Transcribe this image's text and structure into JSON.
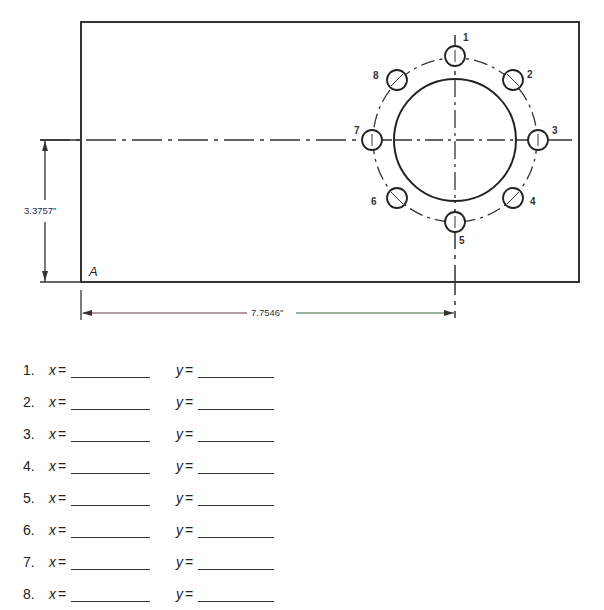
{
  "drawing": {
    "corner_label": "A",
    "dim_vertical": "3.3757\"",
    "dim_horizontal": "7.7546\"",
    "hole_labels": [
      "1",
      "2",
      "3",
      "4",
      "5",
      "6",
      "7",
      "8"
    ]
  },
  "answers": {
    "x_label": "x",
    "y_label": "y",
    "eq": "=",
    "rows": [
      {
        "num": "1."
      },
      {
        "num": "2."
      },
      {
        "num": "3."
      },
      {
        "num": "4."
      },
      {
        "num": "5."
      },
      {
        "num": "6."
      },
      {
        "num": "7."
      },
      {
        "num": "8."
      }
    ]
  }
}
